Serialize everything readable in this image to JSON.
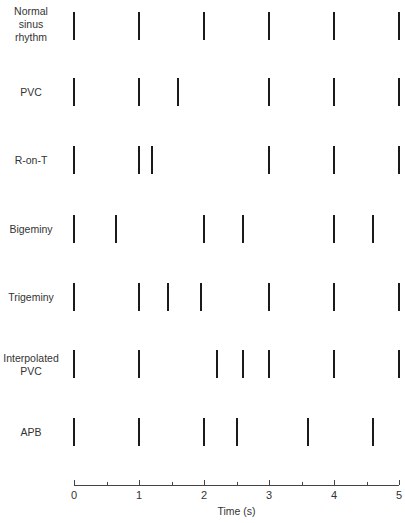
{
  "chart_data": {
    "type": "scatter",
    "title": "",
    "xlabel": "Time (s)",
    "ylabel": "",
    "xlim": [
      0,
      5
    ],
    "x_ticks": [
      0,
      1,
      2,
      3,
      4,
      5
    ],
    "x_tick_labels": [
      "0",
      "1",
      "2",
      "3",
      "4",
      "5"
    ],
    "x_minor_ticks": [
      0.5,
      1.5,
      2.5,
      3.5,
      4.5
    ],
    "grid": false,
    "legend": null,
    "marker": "vertical-bar",
    "series": [
      {
        "name": "Normal sinus rhythm",
        "label_lines": [
          "Normal",
          "sinus",
          "rhythm"
        ],
        "values": [
          0,
          1,
          2,
          3,
          4,
          5
        ]
      },
      {
        "name": "PVC",
        "label_lines": [
          "PVC"
        ],
        "values": [
          0,
          1,
          1.6,
          3,
          4,
          5
        ]
      },
      {
        "name": "R-on-T",
        "label_lines": [
          "R-on-T"
        ],
        "values": [
          0,
          1,
          1.2,
          3,
          4,
          5
        ]
      },
      {
        "name": "Bigeminy",
        "label_lines": [
          "Bigeminy"
        ],
        "values": [
          0,
          0.65,
          2,
          2.6,
          4,
          4.6
        ]
      },
      {
        "name": "Trigeminy",
        "label_lines": [
          "Trigeminy"
        ],
        "values": [
          0,
          1,
          1.45,
          1.95,
          3,
          4,
          5
        ]
      },
      {
        "name": "Interpolated PVC",
        "label_lines": [
          "Interpolated",
          "PVC"
        ],
        "values": [
          0,
          1,
          2.2,
          2.6,
          3,
          4,
          5
        ]
      },
      {
        "name": "APB",
        "label_lines": [
          "APB"
        ],
        "values": [
          0,
          1,
          2,
          2.5,
          3.6,
          4.6
        ]
      }
    ]
  },
  "layout": {
    "x0_px": 74,
    "px_per_s": 65,
    "rows": [
      {
        "top": 12,
        "height": 28,
        "label_top": 5
      },
      {
        "top": 78,
        "height": 28,
        "label_top": 86
      },
      {
        "top": 146,
        "height": 28,
        "label_top": 154
      },
      {
        "top": 215,
        "height": 28,
        "label_top": 223
      },
      {
        "top": 283,
        "height": 28,
        "label_top": 291
      },
      {
        "top": 350,
        "height": 28,
        "label_top": 352
      },
      {
        "top": 418,
        "height": 28,
        "label_top": 426
      }
    ],
    "axis_y": 485
  }
}
